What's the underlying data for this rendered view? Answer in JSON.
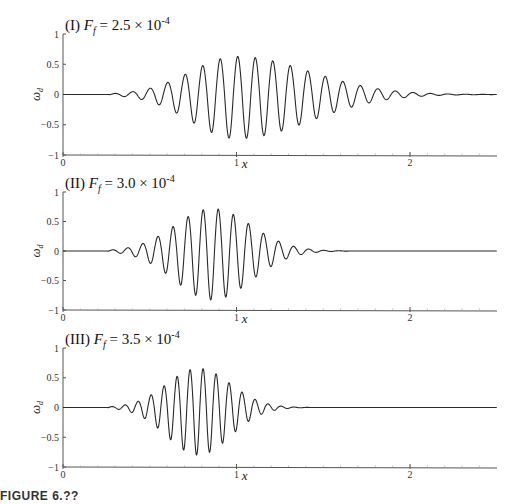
{
  "caption": "FIGURE 6.??",
  "chart_data": [
    {
      "type": "line",
      "panel": "I",
      "title": "(I) F_f = 2.5 × 10^-4",
      "title_prefix": "(I)",
      "title_var": "F",
      "title_sub": "f",
      "title_value": "= 2.5 × 10",
      "title_exp": "-4",
      "xlabel": "x",
      "ylabel": "ω_d",
      "xlim": [
        0,
        2.5
      ],
      "ylim": [
        -1,
        1
      ],
      "xticks": [
        0,
        1,
        2
      ],
      "yticks": [
        1,
        0.5,
        0,
        -0.5,
        -1
      ],
      "ytick_labels": [
        "1",
        "0.5",
        "0",
        "−0.5",
        "−1"
      ],
      "grid": false,
      "wave": {
        "onset": 0.27,
        "center": 1.0,
        "rise": 0.55,
        "decay": 0.75,
        "period": 0.101,
        "peak_max": 0.63,
        "trough_min": -0.73,
        "end": 2.5
      },
      "description": "Wave packet starting near x≈0.27, growing to max ≈ +0.63 / −0.73 around x≈1.0, slowly decaying toward x≈2.5"
    },
    {
      "type": "line",
      "panel": "II",
      "title": "(II) F_f = 3.0 × 10^-4",
      "title_prefix": "(II)",
      "title_var": "F",
      "title_sub": "f",
      "title_value": "= 3.0 × 10",
      "title_exp": "-4",
      "xlabel": "x",
      "ylabel": "ω_d",
      "xlim": [
        0,
        2.5
      ],
      "ylim": [
        -1,
        1
      ],
      "xticks": [
        0,
        1,
        2
      ],
      "yticks": [
        1,
        0.5,
        0,
        -0.5,
        -1
      ],
      "ytick_labels": [
        "1",
        "0.5",
        "0",
        "−0.5",
        "−1"
      ],
      "grid": false,
      "wave": {
        "onset": 0.26,
        "center": 0.86,
        "rise": 0.45,
        "decay": 0.4,
        "period": 0.087,
        "peak_max": 0.72,
        "trough_min": -0.83,
        "end": 2.5
      },
      "description": "Wave packet starting near x≈0.26, max ≈ +0.72 / −0.83 around x≈0.85, decaying to ~0 by x≈1.7"
    },
    {
      "type": "line",
      "panel": "III",
      "title": "(III) F_f = 3.5 × 10^-4",
      "title_prefix": "(III)",
      "title_var": "F",
      "title_sub": "f",
      "title_value": "= 3.5 × 10",
      "title_exp": "-4",
      "xlabel": "x",
      "ylabel": "ω_d",
      "xlim": [
        0,
        2.5
      ],
      "ylim": [
        -1,
        1
      ],
      "xticks": [
        0,
        1,
        2
      ],
      "yticks": [
        1,
        0.5,
        0,
        -0.5,
        -1
      ],
      "ytick_labels": [
        "1",
        "0.5",
        "0",
        "−0.5",
        "−1"
      ],
      "grid": false,
      "wave": {
        "onset": 0.26,
        "center": 0.78,
        "rise": 0.38,
        "decay": 0.33,
        "period": 0.075,
        "peak_max": 0.66,
        "trough_min": -0.8,
        "end": 2.5
      },
      "description": "Wave packet starting near x≈0.26, max ≈ +0.66 / −0.80 around x≈0.78, decaying to ~0 by x≈1.45"
    }
  ],
  "layout": {
    "x0_px": 63,
    "x_unit_px": 173.5,
    "x_end_px": 497,
    "panels": [
      {
        "y_top_px": 34,
        "y_bottom_px": 155
      },
      {
        "y_top_px": 192,
        "y_bottom_px": 310
      },
      {
        "y_top_px": 348,
        "y_bottom_px": 467
      }
    ]
  },
  "colors": {
    "line": "#2a2a2a",
    "axis": "#555555"
  }
}
